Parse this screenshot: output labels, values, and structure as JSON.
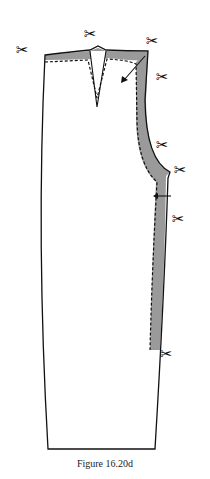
{
  "figure": {
    "caption": "Figure 16.20d",
    "colors": {
      "outline": "#111111",
      "shaded": "#9a9a9a",
      "background": "#ffffff"
    }
  },
  "icons": {
    "scissors": "✂"
  },
  "scissors_marks": [
    {
      "x": 16,
      "y": 43,
      "label": "✂"
    },
    {
      "x": 84,
      "y": 27,
      "label": "✂"
    },
    {
      "x": 146,
      "y": 34,
      "label": "✂"
    },
    {
      "x": 156,
      "y": 70,
      "label": "✂"
    },
    {
      "x": 156,
      "y": 138,
      "label": "✂"
    },
    {
      "x": 174,
      "y": 163,
      "label": "✂"
    },
    {
      "x": 172,
      "y": 212,
      "label": "✂"
    },
    {
      "x": 160,
      "y": 347,
      "label": "✂"
    }
  ]
}
